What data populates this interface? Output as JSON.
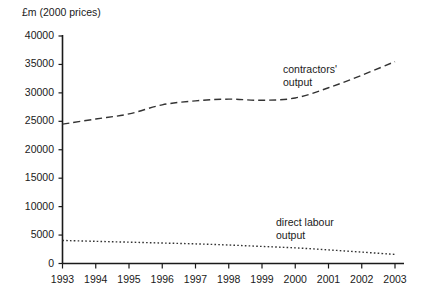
{
  "chart_data": {
    "type": "line",
    "title": "£m (2000 prices)",
    "xlabel": "",
    "ylabel": "£m (2000 prices)",
    "x": [
      "1993",
      "1994",
      "1995",
      "1996",
      "1997",
      "1998",
      "1999",
      "2000",
      "2001",
      "2002",
      "2003"
    ],
    "xlim": [
      1993,
      2003
    ],
    "ylim": [
      0,
      40000
    ],
    "yticks": [
      0,
      5000,
      10000,
      15000,
      20000,
      25000,
      30000,
      35000,
      40000
    ],
    "ytick_labels": [
      "0",
      "5000",
      "10000",
      "15000",
      "20000",
      "25000",
      "30000",
      "35000",
      "40000"
    ],
    "grid": false,
    "legend_position": "inline-annotations",
    "series": [
      {
        "name": "contractors' output",
        "style": "dashed",
        "color": "#333333",
        "values": [
          24500,
          25400,
          26300,
          27900,
          28600,
          28900,
          28700,
          29100,
          30900,
          33100,
          35500
        ]
      },
      {
        "name": "direct labour output",
        "style": "dotted",
        "color": "#333333",
        "values": [
          4050,
          3900,
          3750,
          3600,
          3450,
          3250,
          3000,
          2750,
          2400,
          2000,
          1600
        ]
      }
    ],
    "annotations": [
      {
        "id": "contractors",
        "line1": "contractors'",
        "line2": "output"
      },
      {
        "id": "direct",
        "line1": "direct labour",
        "line2": "output"
      }
    ]
  },
  "axis": {
    "line_color": "#1a1a1a"
  }
}
